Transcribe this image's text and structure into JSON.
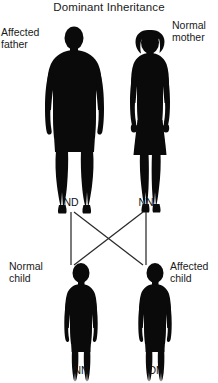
{
  "figure": {
    "title": "Dominant Inheritance",
    "parents": [
      {
        "id": "father",
        "label": "Affected\nfather",
        "genotype": "ND",
        "status": "affected",
        "sex": "male",
        "silhouette": "adult-male-silhouette"
      },
      {
        "id": "mother",
        "label": "Normal\nmother",
        "genotype": "NN",
        "status": "normal",
        "sex": "female",
        "silhouette": "adult-female-silhouette"
      }
    ],
    "children": [
      {
        "id": "child-left",
        "label": "Normal\nchild",
        "genotype": "NN",
        "status": "normal",
        "silhouette": "child-silhouette"
      },
      {
        "id": "child-right",
        "label": "Affected\nchild",
        "genotype": "DN",
        "status": "affected",
        "silhouette": "child-silhouette"
      }
    ],
    "colors": {
      "silhouette": "#0a0a0a",
      "line": "#2a2a2a",
      "text": "#1a1a1a",
      "background": "#ffffff"
    }
  }
}
